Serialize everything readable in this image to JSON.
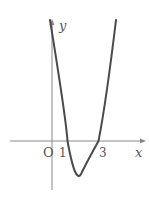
{
  "diagram": {
    "type": "function-graph",
    "axes": {
      "x_label": "x",
      "y_label": "y",
      "origin_label": "O"
    },
    "ticks": {
      "x": [
        "1",
        "3"
      ]
    },
    "curve": {
      "kind": "parabola",
      "roots": [
        1,
        3
      ],
      "vertex_x": 2,
      "opens": "up"
    },
    "colors": {
      "curve": "#4a4a4a",
      "axis": "#8a8a8a",
      "label": "#555555"
    }
  }
}
